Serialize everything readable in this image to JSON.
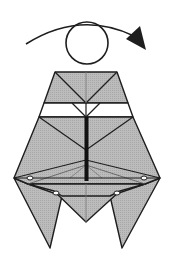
{
  "diagram": {
    "type": "origami-step",
    "description": "Turn the model over",
    "colors": {
      "paper": "#b4b4b4",
      "line": "#1e1e1e",
      "background": "#ffffff",
      "white_band": "#ffffff"
    },
    "symbols": {
      "turn_over_arrow": "curved-arrow-right",
      "turn_over_circle": "circle"
    }
  }
}
